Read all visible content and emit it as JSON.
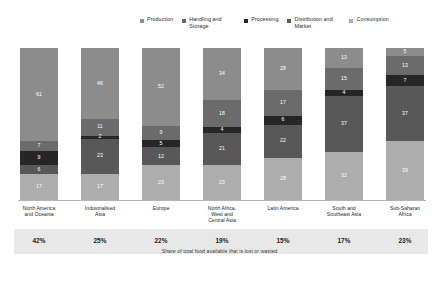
{
  "chart_data": {
    "type": "bar",
    "title": "",
    "subtitle": "",
    "xlabel": "",
    "ylabel": "",
    "ylim": [
      0,
      100
    ],
    "stacked": true,
    "normalized_percent": true,
    "grid": false,
    "legend_position": "top",
    "categories": [
      "North America and Oceania",
      "Industrialised Asia",
      "Europe",
      "North Africa, West and Central Asia",
      "Latin America",
      "South and Southeast Asia",
      "Sub-Saharan Africa"
    ],
    "series": [
      {
        "name": "Production",
        "color": "#8c8c8c",
        "values": [
          61,
          46,
          52,
          34,
          28,
          13,
          5
        ]
      },
      {
        "name": "Handling and Storage",
        "color": "#6b6b6b",
        "values": [
          7,
          11,
          9,
          18,
          17,
          15,
          13
        ]
      },
      {
        "name": "Processing",
        "color": "#262626",
        "values": [
          9,
          2,
          5,
          4,
          6,
          4,
          7
        ]
      },
      {
        "name": "Distribution and Market",
        "color": "#585858",
        "values": [
          6,
          23,
          12,
          21,
          22,
          37,
          37
        ]
      },
      {
        "name": "Consumption",
        "color": "#adadad",
        "values": [
          17,
          17,
          23,
          23,
          28,
          32,
          39
        ]
      }
    ],
    "annotations": {
      "footer_values": [
        "42%",
        "25%",
        "22%",
        "19%",
        "15%",
        "17%",
        "23%"
      ],
      "footer_caption": "Share of total food available that is lost or wasted"
    }
  },
  "legend": {
    "items": [
      {
        "label": "Production",
        "swatch_color": "#8c8c8c"
      },
      {
        "label": "Handling and Storage",
        "swatch_color": "#6b6b6b"
      },
      {
        "label": "Processing",
        "swatch_color": "#262626"
      },
      {
        "label": "Distribution and Market",
        "swatch_color": "#585858"
      },
      {
        "label": "Consumption",
        "swatch_color": "#adadad"
      }
    ]
  },
  "columns": [
    {
      "region": "North America and Oceania",
      "percent": "42%",
      "segments": [
        {
          "stage": "Production",
          "value": "61",
          "color": "#8c8c8c"
        },
        {
          "stage": "Handling and Storage",
          "value": "7",
          "color": "#6b6b6b"
        },
        {
          "stage": "Processing",
          "value": "9",
          "color": "#262626"
        },
        {
          "stage": "Distribution and Market",
          "value": "6",
          "color": "#585858"
        },
        {
          "stage": "Consumption",
          "value": "17",
          "color": "#adadad"
        }
      ]
    },
    {
      "region": "Industrialised Asia",
      "percent": "25%",
      "segments": [
        {
          "stage": "Production",
          "value": "46",
          "color": "#8c8c8c"
        },
        {
          "stage": "Handling and Storage",
          "value": "11",
          "color": "#6b6b6b"
        },
        {
          "stage": "Processing",
          "value": "2",
          "color": "#262626"
        },
        {
          "stage": "Distribution and Market",
          "value": "23",
          "color": "#585858"
        },
        {
          "stage": "Consumption",
          "value": "17",
          "color": "#adadad"
        }
      ]
    },
    {
      "region": "Europe",
      "percent": "22%",
      "segments": [
        {
          "stage": "Production",
          "value": "52",
          "color": "#8c8c8c"
        },
        {
          "stage": "Handling and Storage",
          "value": "9",
          "color": "#6b6b6b"
        },
        {
          "stage": "Processing",
          "value": "5",
          "color": "#262626"
        },
        {
          "stage": "Distribution and Market",
          "value": "12",
          "color": "#585858"
        },
        {
          "stage": "Consumption",
          "value": "23",
          "color": "#adadad"
        }
      ]
    },
    {
      "region": "North Africa, West and Central Asia",
      "percent": "19%",
      "segments": [
        {
          "stage": "Production",
          "value": "34",
          "color": "#8c8c8c"
        },
        {
          "stage": "Handling and Storage",
          "value": "18",
          "color": "#6b6b6b"
        },
        {
          "stage": "Processing",
          "value": "4",
          "color": "#262626"
        },
        {
          "stage": "Distribution and Market",
          "value": "21",
          "color": "#585858"
        },
        {
          "stage": "Consumption",
          "value": "23",
          "color": "#adadad"
        }
      ]
    },
    {
      "region": "Latin America",
      "percent": "15%",
      "segments": [
        {
          "stage": "Production",
          "value": "28",
          "color": "#8c8c8c"
        },
        {
          "stage": "Handling and Storage",
          "value": "17",
          "color": "#6b6b6b"
        },
        {
          "stage": "Processing",
          "value": "6",
          "color": "#262626"
        },
        {
          "stage": "Distribution and Market",
          "value": "22",
          "color": "#585858"
        },
        {
          "stage": "Consumption",
          "value": "28",
          "color": "#adadad"
        }
      ]
    },
    {
      "region": "South and Southeast Asia",
      "percent": "17%",
      "segments": [
        {
          "stage": "Production",
          "value": "13",
          "color": "#8c8c8c"
        },
        {
          "stage": "Handling and Storage",
          "value": "15",
          "color": "#6b6b6b"
        },
        {
          "stage": "Processing",
          "value": "4",
          "color": "#262626"
        },
        {
          "stage": "Distribution and Market",
          "value": "37",
          "color": "#585858"
        },
        {
          "stage": "Consumption",
          "value": "32",
          "color": "#adadad"
        }
      ]
    },
    {
      "region": "Sub-Saharan Africa",
      "percent": "23%",
      "segments": [
        {
          "stage": "Production",
          "value": "5",
          "color": "#8c8c8c"
        },
        {
          "stage": "Handling and Storage",
          "value": "13",
          "color": "#6b6b6b"
        },
        {
          "stage": "Processing",
          "value": "7",
          "color": "#262626"
        },
        {
          "stage": "Distribution and Market",
          "value": "37",
          "color": "#585858"
        },
        {
          "stage": "Consumption",
          "value": "39",
          "color": "#adadad"
        }
      ]
    }
  ],
  "footer": {
    "caption": "Share of total food available that is lost or wasted"
  }
}
